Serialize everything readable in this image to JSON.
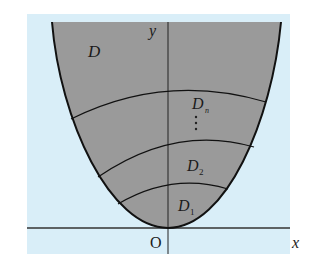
{
  "figure": {
    "colors": {
      "background_panel": "#d9eef8",
      "region_fill": "#9a9a9a",
      "curve_stroke": "#111111",
      "axis_stroke": "#333333"
    },
    "labels": {
      "region_D": "D",
      "region_Dn_main": "D",
      "region_Dn_sub": "n",
      "ellipsis": "⋮",
      "region_D2_main": "D",
      "region_D2_sub": "2",
      "region_D1_main": "D",
      "region_D1_sub": "1",
      "origin": "O",
      "x_axis": "x",
      "y_axis": "y"
    }
  }
}
